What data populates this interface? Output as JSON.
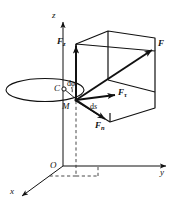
{
  "figure": {
    "background_color": "#ffffff",
    "stroke_color": "#111111",
    "axes": {
      "z_label": "z",
      "y_label": "y",
      "x_label": "x",
      "origin_label": "O"
    },
    "points": {
      "center_label": "C",
      "particle_label": "M"
    },
    "forces": {
      "resultant": {
        "label": "F",
        "subscript": ""
      },
      "vertical": {
        "label": "F",
        "subscript": "z"
      },
      "tangential": {
        "label": "F",
        "subscript": "τ"
      },
      "normal": {
        "label": "F",
        "subscript": "n"
      }
    },
    "differentials": {
      "angle": {
        "d": "d",
        "symbol": "φ"
      },
      "arc": {
        "d": "d",
        "symbol": "s"
      }
    }
  }
}
